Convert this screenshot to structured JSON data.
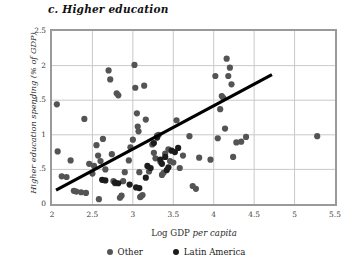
{
  "chart_data": {
    "type": "scatter",
    "title": "c. Higher education",
    "xlabel": "Log GDP per capita",
    "ylabel": "Higher education spending  (% of GDP)",
    "xlim": [
      2,
      5.5
    ],
    "ylim": [
      0,
      2.5
    ],
    "xticks": [
      "2",
      "2.5",
      "3",
      "3.5",
      "4",
      "4.5",
      "5",
      "5.5"
    ],
    "xtick_values": [
      2,
      2.5,
      3,
      3.5,
      4,
      4.5,
      5,
      5.5
    ],
    "yticks": [
      "0",
      ".5",
      "1",
      "1.5",
      "2",
      "2.5"
    ],
    "ytick_values": [
      0,
      0.5,
      1,
      1.5,
      2,
      2.5
    ],
    "grid": true,
    "legend_position": "bottom",
    "colors": {
      "other": "#545454",
      "latin_america": "#1c1c1c",
      "trendline": "#000000",
      "frame": "#9a9a9a",
      "gridline": "#c9c9c9"
    },
    "legend": [
      {
        "label": "Other",
        "color": "#545454"
      },
      {
        "label": "Latin America",
        "color": "#1c1c1c"
      }
    ],
    "trendline": {
      "name": "Fitted trend",
      "x": [
        2.05,
        4.72
      ],
      "y": [
        0.2,
        1.87
      ]
    },
    "series": [
      {
        "name": "Other",
        "color": "#545454",
        "points": [
          [
            2.06,
            1.44
          ],
          [
            2.07,
            0.76
          ],
          [
            2.12,
            0.4
          ],
          [
            2.18,
            0.39
          ],
          [
            2.23,
            0.63
          ],
          [
            2.27,
            0.19
          ],
          [
            2.3,
            0.18
          ],
          [
            2.36,
            0.17
          ],
          [
            2.4,
            1.23
          ],
          [
            2.42,
            0.16
          ],
          [
            2.46,
            0.58
          ],
          [
            2.5,
            0.44
          ],
          [
            2.52,
            0.55
          ],
          [
            2.55,
            0.85
          ],
          [
            2.57,
            0.7
          ],
          [
            2.58,
            0.07
          ],
          [
            2.6,
            0.62
          ],
          [
            2.63,
            0.94
          ],
          [
            2.66,
            0.5
          ],
          [
            2.7,
            1.93
          ],
          [
            2.72,
            1.8
          ],
          [
            2.74,
            0.72
          ],
          [
            2.76,
            0.33
          ],
          [
            2.78,
            0.3
          ],
          [
            2.8,
            1.6
          ],
          [
            2.82,
            1.57
          ],
          [
            2.84,
            0.09
          ],
          [
            2.86,
            0.12
          ],
          [
            2.88,
            0.33
          ],
          [
            2.9,
            0.46
          ],
          [
            2.95,
            0.63
          ],
          [
            2.97,
            0.82
          ],
          [
            3.0,
            0.93
          ],
          [
            3.02,
            2.01
          ],
          [
            3.03,
            1.68
          ],
          [
            3.05,
            1.31
          ],
          [
            3.06,
            1.12
          ],
          [
            3.07,
            1.05
          ],
          [
            3.08,
            0.46
          ],
          [
            3.09,
            0.1
          ],
          [
            3.1,
            0.11
          ],
          [
            3.12,
            0.13
          ],
          [
            3.14,
            1.71
          ],
          [
            3.16,
            1.22
          ],
          [
            3.2,
            0.47
          ],
          [
            3.24,
            0.86
          ],
          [
            3.26,
            0.74
          ],
          [
            3.28,
            0.66
          ],
          [
            3.3,
            0.99
          ],
          [
            3.32,
            1.0
          ],
          [
            3.34,
            0.61
          ],
          [
            3.36,
            0.42
          ],
          [
            3.38,
            0.45
          ],
          [
            3.4,
            0.73
          ],
          [
            3.44,
            0.79
          ],
          [
            3.46,
            0.62
          ],
          [
            3.5,
            0.6
          ],
          [
            3.54,
            1.21
          ],
          [
            3.58,
            0.52
          ],
          [
            3.62,
            0.7
          ],
          [
            3.7,
            0.98
          ],
          [
            3.74,
            0.26
          ],
          [
            3.78,
            0.22
          ],
          [
            3.82,
            0.67
          ],
          [
            3.96,
            0.64
          ],
          [
            4.02,
            1.85
          ],
          [
            4.05,
            0.95
          ],
          [
            4.08,
            1.37
          ],
          [
            4.1,
            1.56
          ],
          [
            4.12,
            1.53
          ],
          [
            4.14,
            1.09
          ],
          [
            4.16,
            2.1
          ],
          [
            4.18,
            1.85
          ],
          [
            4.2,
            1.97
          ],
          [
            4.22,
            1.73
          ],
          [
            4.24,
            0.68
          ],
          [
            4.28,
            0.89
          ],
          [
            4.34,
            0.9
          ],
          [
            4.4,
            0.97
          ],
          [
            5.28,
            0.98
          ]
        ]
      },
      {
        "name": "Latin America",
        "color": "#1c1c1c",
        "points": [
          [
            2.62,
            0.35
          ],
          [
            2.66,
            0.34
          ],
          [
            2.78,
            0.31
          ],
          [
            2.82,
            0.3
          ],
          [
            2.96,
            0.28
          ],
          [
            3.04,
            0.24
          ],
          [
            3.08,
            0.23
          ],
          [
            3.16,
            0.38
          ],
          [
            3.18,
            0.55
          ],
          [
            3.22,
            0.52
          ],
          [
            3.26,
            0.88
          ],
          [
            3.3,
            0.96
          ],
          [
            3.34,
            0.64
          ],
          [
            3.36,
            0.58
          ],
          [
            3.4,
            0.68
          ],
          [
            3.42,
            0.49
          ],
          [
            3.44,
            0.53
          ],
          [
            3.48,
            0.77
          ],
          [
            3.52,
            0.75
          ],
          [
            3.56,
            0.81
          ]
        ]
      }
    ]
  }
}
